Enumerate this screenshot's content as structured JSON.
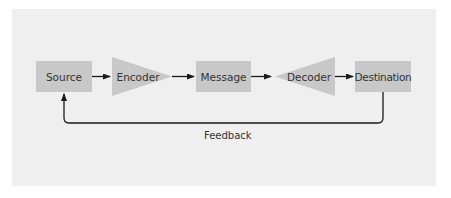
{
  "diagram": {
    "type": "communication-model",
    "colors": {
      "background": "#ffffff",
      "panel": "#efefef",
      "shape_fill": "#c8c8c8",
      "arrow": "#1a1a1a",
      "text": "#333333"
    },
    "nodes": [
      {
        "id": "source",
        "label": "Source",
        "shape": "rectangle"
      },
      {
        "id": "encoder",
        "label": "Encoder",
        "shape": "triangle-right"
      },
      {
        "id": "message",
        "label": "Message",
        "shape": "rectangle"
      },
      {
        "id": "decoder",
        "label": "Decoder",
        "shape": "triangle-left"
      },
      {
        "id": "destination",
        "label": "Destination",
        "shape": "rectangle"
      }
    ],
    "edges": [
      {
        "from": "source",
        "to": "encoder"
      },
      {
        "from": "encoder",
        "to": "message"
      },
      {
        "from": "message",
        "to": "decoder"
      },
      {
        "from": "decoder",
        "to": "destination"
      },
      {
        "from": "destination",
        "to": "source",
        "label": "Feedback"
      }
    ],
    "feedback_label": "Feedback"
  }
}
